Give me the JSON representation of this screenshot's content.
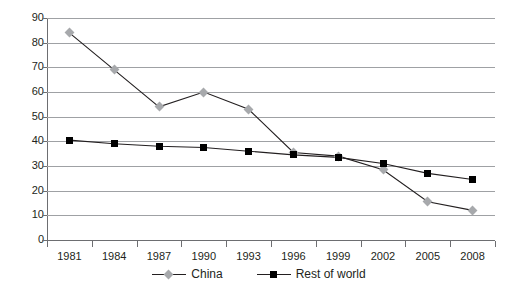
{
  "chart_data": {
    "type": "line",
    "title": "",
    "subtitle": "",
    "xlabel": "",
    "ylabel": "",
    "categories": [
      "1981",
      "1984",
      "1987",
      "1990",
      "1993",
      "1996",
      "1999",
      "2002",
      "2005",
      "2008"
    ],
    "series": [
      {
        "name": "China",
        "color": "#a7a9ac",
        "line_color": "#231f20",
        "marker": "diamond",
        "values": [
          84,
          69,
          54,
          60,
          53,
          35.5,
          34,
          28.5,
          15.5,
          12
        ]
      },
      {
        "name": "Rest of world",
        "color": "#000000",
        "line_color": "#231f20",
        "marker": "square",
        "values": [
          40.5,
          39,
          38,
          37.5,
          36,
          34.5,
          33.5,
          31,
          27,
          24.5
        ]
      }
    ],
    "ylim": [
      0,
      90
    ],
    "ytick_step": 10,
    "yticks": [
      "90",
      "80",
      "70",
      "60",
      "50",
      "40",
      "30",
      "20",
      "10",
      "0"
    ],
    "grid": "horizontal",
    "legend_position": "bottom"
  },
  "legend": {
    "items": [
      {
        "label": "China",
        "marker": "diamond",
        "color": "#a7a9ac"
      },
      {
        "label": "Rest of world",
        "marker": "square",
        "color": "#000000"
      }
    ]
  },
  "colors": {
    "china": "#a7a9ac",
    "rest_of_world": "#000000",
    "grid": "#9fa1a4",
    "axis": "#6d6e71",
    "text": "#231f20",
    "background": "#ffffff"
  }
}
